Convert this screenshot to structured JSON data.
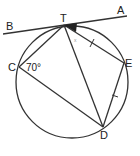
{
  "diagram": {
    "type": "circle-geometry",
    "points": {
      "T": {
        "label": "T",
        "x": 64,
        "y": 25
      },
      "C": {
        "label": "C",
        "x": 19,
        "y": 67
      },
      "E": {
        "label": "E",
        "x": 124,
        "y": 63
      },
      "D": {
        "label": "D",
        "x": 103,
        "y": 127
      },
      "A": {
        "label": "A",
        "x": 126,
        "y": 15
      },
      "B": {
        "label": "B",
        "x": 4,
        "y": 34
      }
    },
    "circle": {
      "cx": 72,
      "cy": 82,
      "r": 56
    },
    "tangent_line": {
      "label": "BA",
      "touches": "T"
    },
    "segments": [
      "TC",
      "TD",
      "TE",
      "CD",
      "ED"
    ],
    "angle_labels": {
      "C": "70°",
      "ATE": "x"
    },
    "equal_marks": [
      "TE",
      "ED"
    ]
  }
}
